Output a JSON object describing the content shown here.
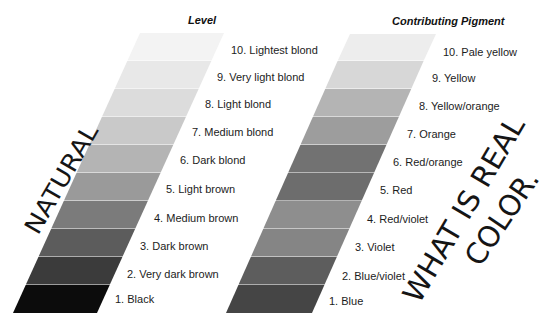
{
  "level_column": {
    "header": "Level",
    "bands": [
      {
        "label": "10. Lightest blond",
        "color": "#f3f3f3"
      },
      {
        "label": "9. Very light blond",
        "color": "#e8e8e8"
      },
      {
        "label": "8. Light blond",
        "color": "#dcdcdc"
      },
      {
        "label": "7. Medium blond",
        "color": "#c9c9c9"
      },
      {
        "label": "6. Dark blond",
        "color": "#b4b4b4"
      },
      {
        "label": "5. Light brown",
        "color": "#9a9a9a"
      },
      {
        "label": "4. Medium brown",
        "color": "#7b7b7b"
      },
      {
        "label": "3. Dark brown",
        "color": "#5c5c5c"
      },
      {
        "label": "2. Very dark brown",
        "color": "#3b3b3b"
      },
      {
        "label": "1. Black",
        "color": "#0c0c0c"
      }
    ]
  },
  "pigment_column": {
    "header": "Contributing Pigment",
    "bands": [
      {
        "label": "10. Pale yellow",
        "color": "#ededed"
      },
      {
        "label": "9. Yellow",
        "color": "#d7d7d7"
      },
      {
        "label": "8. Yellow/orange",
        "color": "#b4b4b4"
      },
      {
        "label": "7. Orange",
        "color": "#9d9d9d"
      },
      {
        "label": "6. Red/orange",
        "color": "#727272"
      },
      {
        "label": "5. Red",
        "color": "#6d6d6d"
      },
      {
        "label": "4. Red/violet",
        "color": "#8e8e8e"
      },
      {
        "label": "3. Violet",
        "color": "#858585"
      },
      {
        "label": "2. Blue/violet",
        "color": "#5d5d5d"
      },
      {
        "label": "1. Blue",
        "color": "#454545"
      }
    ]
  },
  "annotations": {
    "natural": "NATURAL",
    "what_is_real": "WHAT IS REAL",
    "color": "COLOR."
  }
}
